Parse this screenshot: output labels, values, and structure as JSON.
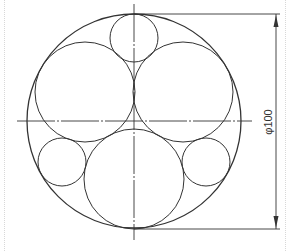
{
  "drawing": {
    "type": "engineering-drawing",
    "description": "Circle packing in a circle with center lines and diameter dimension",
    "stroke_color": "#333333",
    "background": "#ffffff"
  },
  "outer_circle": {
    "cx": 134,
    "cy": 121,
    "r": 107
  },
  "large_circles": [
    {
      "name": "upper-left",
      "cx": 85,
      "cy": 92,
      "r": 50
    },
    {
      "name": "upper-right",
      "cx": 183,
      "cy": 92,
      "r": 50
    },
    {
      "name": "bottom",
      "cx": 134,
      "cy": 179,
      "r": 50
    }
  ],
  "small_circles": [
    {
      "name": "top",
      "cx": 134,
      "cy": 38,
      "r": 24
    },
    {
      "name": "left",
      "cx": 62,
      "cy": 162,
      "r": 24
    },
    {
      "name": "right",
      "cx": 206,
      "cy": 162,
      "r": 24
    }
  ],
  "center_lines": {
    "horizontal": {
      "x1": 17,
      "y1": 121,
      "x2": 252,
      "y2": 121
    },
    "vertical": {
      "x1": 134,
      "y1": 4,
      "x2": 134,
      "y2": 240
    }
  },
  "dimension": {
    "label": "φ100",
    "line_x": 276,
    "top_y": 14,
    "bottom_y": 229
  }
}
